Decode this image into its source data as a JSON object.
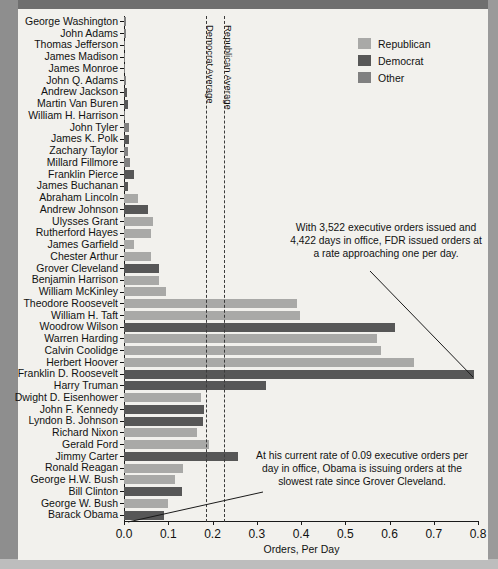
{
  "chart_data": {
    "type": "bar",
    "orientation": "horizontal",
    "title": "",
    "xlabel": "Orders, Per Day",
    "ylabel": "",
    "xlim": [
      0.0,
      0.8
    ],
    "xticks": [
      "0.0",
      "0.1",
      "0.2",
      "0.3",
      "0.4",
      "0.5",
      "0.6",
      "0.7",
      "0.8"
    ],
    "xtick_values": [
      0.0,
      0.1,
      0.2,
      0.3,
      0.4,
      0.5,
      0.6,
      0.7,
      0.8
    ],
    "grid": false,
    "legend_position": "top-right",
    "categories": [
      "George Washington",
      "John Adams",
      "Thomas Jefferson",
      "James Madison",
      "James Monroe",
      "John Q. Adams",
      "Andrew Jackson",
      "Martin Van Buren",
      "William H. Harrison",
      "John Tyler",
      "James K. Polk",
      "Zachary Taylor",
      "Millard Fillmore",
      "Franklin Pierce",
      "James Buchanan",
      "Abraham Lincoln",
      "Andrew Johnson",
      "Ulysses Grant",
      "Rutherford Hayes",
      "James Garfield",
      "Chester Arthur",
      "Grover Cleveland",
      "Benjamin Harrison",
      "William McKinley",
      "Theodore Roosevelt",
      "William H. Taft",
      "Woodrow Wilson",
      "Warren Harding",
      "Calvin Coolidge",
      "Herbert Hoover",
      "Franklin D. Roosevelt",
      "Harry Truman",
      "Dwight D. Eisenhower",
      "John F. Kennedy",
      "Lyndon B. Johnson",
      "Richard Nixon",
      "Gerald Ford",
      "Jimmy Carter",
      "Ronald Reagan",
      "George H.W. Bush",
      "Bill Clinton",
      "George W. Bush",
      "Barack Obama"
    ],
    "values": [
      0.005,
      0.004,
      0.003,
      0.002,
      0.002,
      0.005,
      0.006,
      0.008,
      0.001,
      0.012,
      0.012,
      0.01,
      0.013,
      0.022,
      0.01,
      0.032,
      0.054,
      0.065,
      0.062,
      0.022,
      0.062,
      0.08,
      0.079,
      0.094,
      0.392,
      0.398,
      0.613,
      0.572,
      0.58,
      0.656,
      0.79,
      0.32,
      0.175,
      0.18,
      0.178,
      0.166,
      0.191,
      0.258,
      0.133,
      0.116,
      0.13,
      0.1,
      0.09
    ],
    "series_groups": [
      "Other",
      "Other",
      "Other",
      "Other",
      "Other",
      "Other",
      "Democrat",
      "Democrat",
      "Other",
      "Other",
      "Democrat",
      "Other",
      "Other",
      "Democrat",
      "Democrat",
      "Republican",
      "Democrat",
      "Republican",
      "Republican",
      "Republican",
      "Republican",
      "Democrat",
      "Republican",
      "Republican",
      "Republican",
      "Republican",
      "Democrat",
      "Republican",
      "Republican",
      "Republican",
      "Democrat",
      "Democrat",
      "Republican",
      "Democrat",
      "Democrat",
      "Republican",
      "Republican",
      "Democrat",
      "Republican",
      "Republican",
      "Democrat",
      "Republican",
      "Democrat"
    ],
    "legend": [
      {
        "label": "Republican",
        "color": "#a9a9a7"
      },
      {
        "label": "Democrat",
        "color": "#575757"
      },
      {
        "label": "Other",
        "color": "#808080"
      }
    ],
    "reference_lines": [
      {
        "label": "Democrat Average",
        "value": 0.185
      },
      {
        "label": "Republican Average",
        "value": 0.226
      }
    ],
    "annotations": [
      {
        "id": "fdr",
        "text": "With 3,522 executive orders issued and 4,422 days in office, FDR issued orders at a rate approaching one per day."
      },
      {
        "id": "obama",
        "text": "At his current rate of 0.09 executive orders per day in office, Obama is issuing orders at the slowest rate since Grover Cleveland."
      }
    ]
  }
}
